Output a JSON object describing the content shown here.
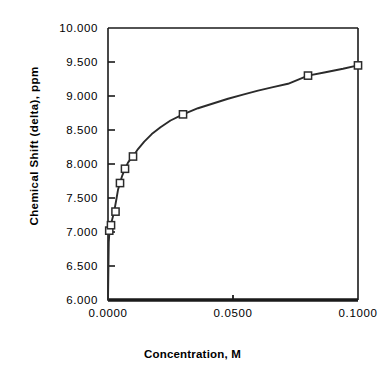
{
  "chart_data": {
    "type": "line",
    "title": "",
    "xlabel": "Concentration, M",
    "ylabel": "Chemical Shift (delta), ppm",
    "xlim": [
      0.0,
      0.1
    ],
    "ylim": [
      6.0,
      10.0
    ],
    "grid": false,
    "legend": "none",
    "marker": "open-square",
    "line_color": "#2b2b2b",
    "xticks": [
      {
        "value": 0.0,
        "label": "0.0000"
      },
      {
        "value": 0.05,
        "label": "0.0500"
      },
      {
        "value": 0.1,
        "label": "0.1000"
      }
    ],
    "yticks": [
      {
        "value": 6.0,
        "label": "6.000"
      },
      {
        "value": 6.5,
        "label": "6.500"
      },
      {
        "value": 7.0,
        "label": "7.000"
      },
      {
        "value": 7.5,
        "label": "7.500"
      },
      {
        "value": 8.0,
        "label": "8.000"
      },
      {
        "value": 8.5,
        "label": "8.500"
      },
      {
        "value": 9.0,
        "label": "9.000"
      },
      {
        "value": 9.5,
        "label": "9.500"
      },
      {
        "value": 10.0,
        "label": "10.000"
      }
    ],
    "series": [
      {
        "name": "Chemical shift vs concentration",
        "x": [
          0.0005,
          0.0012,
          0.003,
          0.0048,
          0.0068,
          0.01,
          0.03,
          0.08,
          0.1
        ],
        "y": [
          7.02,
          7.1,
          7.3,
          7.72,
          7.93,
          8.11,
          8.73,
          9.3,
          9.45
        ]
      }
    ],
    "curve_x": [
      0.0,
      0.0003,
      0.0006,
      0.001,
      0.0015,
      0.002,
      0.0026,
      0.0033,
      0.004,
      0.0048,
      0.0057,
      0.0068,
      0.008,
      0.0092,
      0.01,
      0.012,
      0.0145,
      0.0175,
      0.021,
      0.025,
      0.03,
      0.036,
      0.042,
      0.048,
      0.054,
      0.06,
      0.066,
      0.072,
      0.08,
      0.087,
      0.094,
      0.1
    ],
    "curve_y": [
      6.0,
      6.85,
      7.02,
      7.09,
      7.16,
      7.23,
      7.33,
      7.47,
      7.62,
      7.72,
      7.83,
      7.93,
      8.02,
      8.08,
      8.11,
      8.22,
      8.33,
      8.44,
      8.54,
      8.64,
      8.73,
      8.82,
      8.89,
      8.96,
      9.02,
      9.08,
      9.13,
      9.18,
      9.3,
      9.35,
      9.4,
      9.45
    ]
  }
}
